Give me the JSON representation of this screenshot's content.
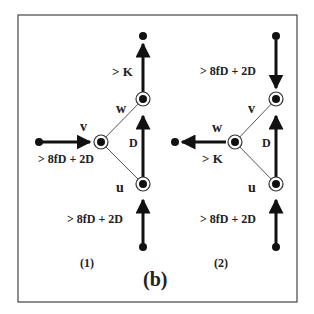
{
  "figure_label": "(b)",
  "panels": [
    {
      "id": "1",
      "caption": "(1)",
      "nodes": {
        "top": "",
        "w": "w",
        "v": "v",
        "u": "u"
      },
      "edge_labels": {
        "top_edge": "> K",
        "left_edge": "> 8fD + 2D",
        "mid_edge": "D",
        "bottom_edge": "> 8fD + 2D"
      }
    },
    {
      "id": "2",
      "caption": "(2)",
      "nodes": {
        "v": "v",
        "w": "w",
        "u": "u"
      },
      "edge_labels": {
        "top_edge": "> 8fD + 2D",
        "left_edge": "> K",
        "mid_edge": "D",
        "bottom_edge": "> 8fD + 2D"
      }
    }
  ]
}
